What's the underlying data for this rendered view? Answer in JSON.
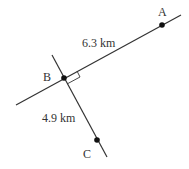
{
  "diagram": {
    "points": [
      {
        "name": "A",
        "x": 162,
        "y": 25,
        "label_x": 158,
        "label_y": 16
      },
      {
        "name": "B",
        "x": 64,
        "y": 78,
        "label_x": 43,
        "label_y": 81
      },
      {
        "name": "C",
        "x": 97,
        "y": 140,
        "label_x": 83,
        "label_y": 158
      }
    ],
    "segments": [
      {
        "name": "AB",
        "label": "6.3 km",
        "label_x": 82,
        "label_y": 47
      },
      {
        "name": "BC",
        "label": "4.9 km",
        "label_x": 42,
        "label_y": 122
      }
    ],
    "right_angle_at": "B",
    "colors": {
      "line": "#333333",
      "point": "#111111",
      "background": "#ffffff"
    }
  }
}
